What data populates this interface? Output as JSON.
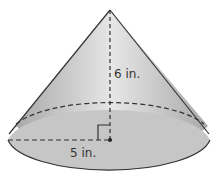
{
  "figure": {
    "shape": "cone",
    "height_label": "6 in.",
    "radius_label": "5 in.",
    "colors": {
      "fill_light": "#e8e8e8",
      "fill_dark": "#a8a8a8",
      "base_fill": "#c4c4c4",
      "stroke": "#333333"
    }
  }
}
